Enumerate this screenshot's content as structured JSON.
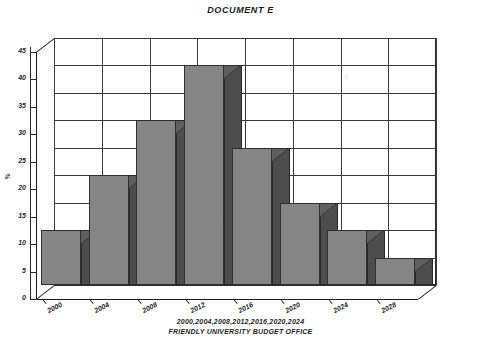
{
  "chart_data": {
    "type": "bar",
    "title": "DOCUMENT E",
    "categories": [
      "2000",
      "2004",
      "2008",
      "2012",
      "2016",
      "2020",
      "2024",
      "2028"
    ],
    "values": [
      10,
      20,
      30,
      40,
      25,
      15,
      10,
      5
    ],
    "xlabel": "2000,2004,2008,2012,2016,2020,2024",
    "ylabel": "%",
    "ylim": [
      0,
      45
    ],
    "ytick_labels": [
      "0",
      "5",
      "10",
      "15",
      "20",
      "25",
      "30",
      "35",
      "40",
      "45"
    ],
    "ytick_values": [
      0,
      5,
      10,
      15,
      20,
      25,
      30,
      35,
      40,
      45
    ],
    "grid": true,
    "legend": "none",
    "style": "3d-bar",
    "source": "FRIENDLY UNIVERSITY BUDGET OFFICE",
    "colors": {
      "bar_front": "#858585",
      "bar_side": "#4d4d4d",
      "bar_top": "#5f5f5f",
      "grid": "#3a3a3a",
      "axis": "#1f1f1f",
      "background": "#ffffff"
    }
  },
  "footer": {
    "line1": "2000,2004,2008,2012,2016,2020,2024",
    "line2": "FRIENDLY UNIVERSITY BUDGET OFFICE"
  }
}
